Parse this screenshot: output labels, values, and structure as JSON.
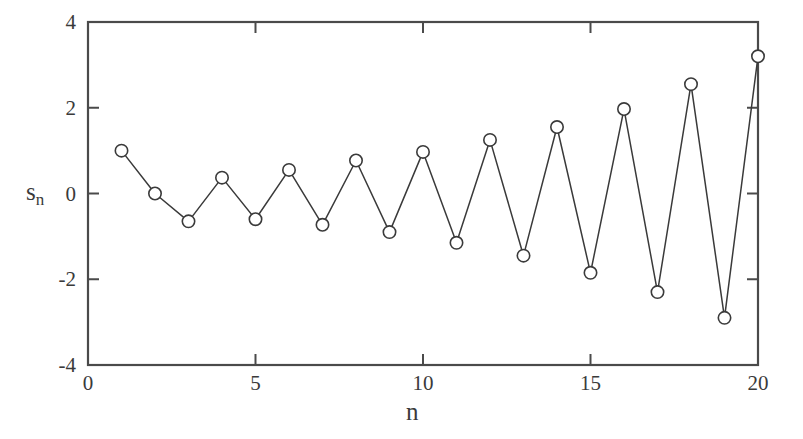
{
  "chart_data": {
    "type": "line",
    "title": "",
    "xlabel": "n",
    "ylabel": "s_n",
    "ylabel_base": "s",
    "ylabel_sub": "n",
    "xlim": [
      0,
      20
    ],
    "ylim": [
      -4,
      4
    ],
    "xticks": [
      0,
      5,
      10,
      15,
      20
    ],
    "xtick_labels": [
      "0",
      "5",
      "10",
      "15",
      "20"
    ],
    "yticks": [
      -4,
      -2,
      0,
      2,
      4
    ],
    "ytick_labels": [
      "-4",
      "-2",
      "0",
      "2",
      "4"
    ],
    "grid": false,
    "legend": null,
    "marker": "open-circle",
    "line_color": "#3a3a3a",
    "marker_color": "#3a3a3a",
    "background_color": "#ffffff",
    "frame_color": "#4a4a4a",
    "x": [
      1,
      2,
      3,
      4,
      5,
      6,
      7,
      8,
      9,
      10,
      11,
      12,
      13,
      14,
      15,
      16,
      17,
      18,
      19,
      20
    ],
    "values": [
      1.0,
      0.0,
      -0.65,
      0.37,
      -0.6,
      0.55,
      -0.73,
      0.77,
      -0.9,
      0.97,
      -1.15,
      1.25,
      -1.45,
      1.55,
      -1.85,
      1.97,
      -2.3,
      2.55,
      -2.9,
      3.2
    ],
    "series": [
      {
        "name": "s_n",
        "values": [
          1.0,
          0.0,
          -0.65,
          0.37,
          -0.6,
          0.55,
          -0.73,
          0.77,
          -0.9,
          0.97,
          -1.15,
          1.25,
          -1.45,
          1.55,
          -1.85,
          1.97,
          -2.3,
          2.55,
          -2.9,
          3.2
        ]
      }
    ]
  },
  "plot_geometry": {
    "left_px": 88,
    "right_px": 758,
    "top_px": 22,
    "bottom_px": 365
  }
}
